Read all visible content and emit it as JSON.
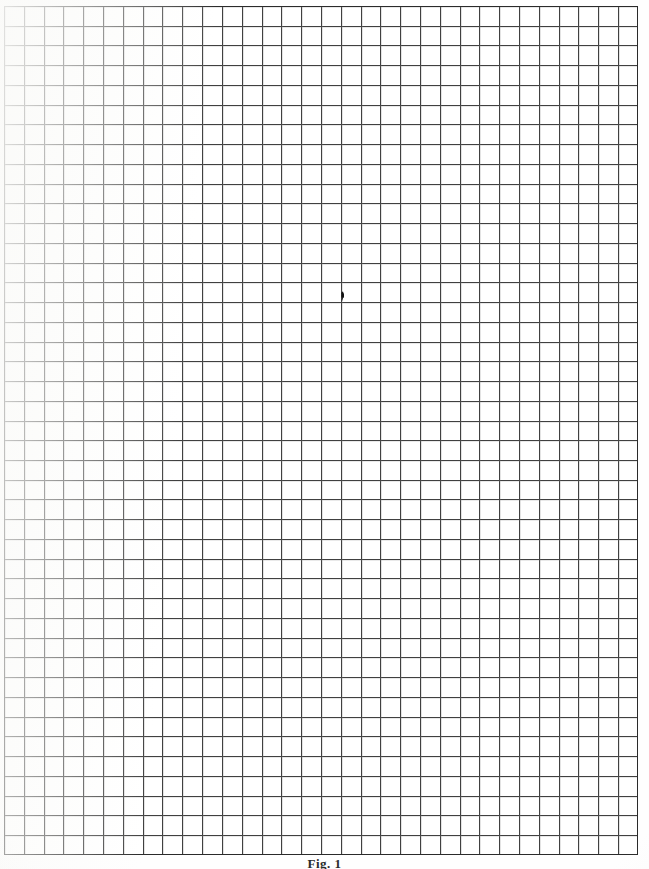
{
  "document": {
    "kind": "grid-paper-scan",
    "title": "Blank quadrille / graph paper sheet",
    "page_width_px": 649,
    "page_height_px": 869,
    "background_color": "#fefefe",
    "paper_color": "#ffffff"
  },
  "grid": {
    "label": "ruled square grid",
    "columns": 32,
    "rows": 43,
    "cell_width_px": 19.81,
    "cell_height_px": 19.74,
    "left_px": 4,
    "top_px": 6,
    "width_px": 634,
    "height_px": 849,
    "line_color": "#3a3a3a",
    "faint_line_color": "#787878",
    "border_color": "#2a2a2a",
    "border_width_px": 1.6
  },
  "annotations": {
    "center_mark": {
      "label": "pen tick mark",
      "x_px": 342,
      "y_px": 297,
      "color": "#141414",
      "description": "small dark hand-drawn tick on a grid intersection near the page centre"
    }
  },
  "footer": {
    "caption_text": "Fig. 1",
    "visible": "clipped at page bottom edge",
    "color": "#2b2b2b"
  }
}
